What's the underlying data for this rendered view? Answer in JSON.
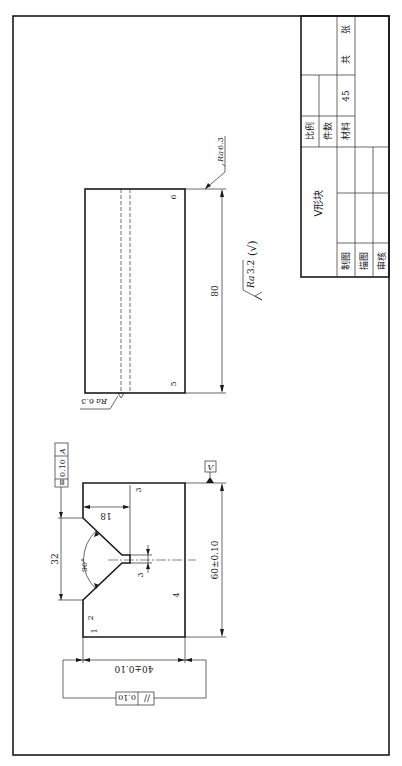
{
  "drawing": {
    "title": "V形块",
    "material": "45",
    "title_block": {
      "scale_label": "比例",
      "quantity_label": "件数",
      "material_label": "材料",
      "material_value": "45",
      "sheets_total_label": "共",
      "sheets_unit_label": "张",
      "drawn_label": "制图",
      "traced_label": "描图",
      "checked_label": "审核",
      "part_name": "V形块"
    },
    "general_roughness": {
      "symbol": "Ra",
      "value": "3.2",
      "suffix": "(√)"
    },
    "front_view": {
      "dim_width": "60±0.10",
      "dim_height": "40±0.10",
      "dim_v_opening": "32",
      "dim_v_depth": "18",
      "dim_slot": "3",
      "angle": "90°",
      "symmetry_tol": {
        "symbol": "≡",
        "value": "0.10",
        "datum": "A"
      },
      "parallel_tol": {
        "symbol": "//",
        "value": "0.10"
      },
      "datum_label": "V",
      "surface_labels": [
        "1",
        "2",
        "3",
        "4"
      ]
    },
    "side_view": {
      "dim_length": "80",
      "roughness_top": {
        "symbol": "Ra",
        "value": "6.3"
      },
      "roughness_bottom": {
        "symbol": "Ra",
        "value": "6.3"
      },
      "surface_labels": [
        "5",
        "6"
      ]
    }
  }
}
